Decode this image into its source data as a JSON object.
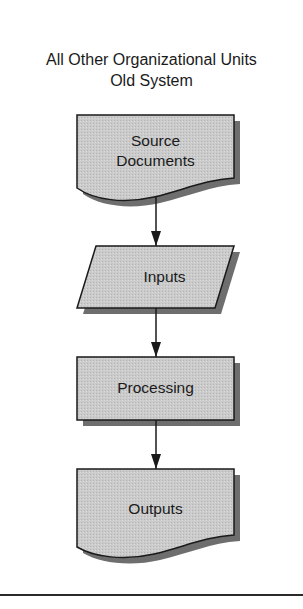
{
  "diagram": {
    "title_line1": "All Other Organizational Units",
    "title_line2": "Old System",
    "nodes": [
      {
        "id": "source-documents",
        "shape": "document",
        "label_line1": "Source",
        "label_line2": "Documents"
      },
      {
        "id": "inputs",
        "shape": "parallelogram",
        "label": "Inputs"
      },
      {
        "id": "processing",
        "shape": "rectangle",
        "label": "Processing"
      },
      {
        "id": "outputs",
        "shape": "document",
        "label": "Outputs"
      }
    ],
    "edges": [
      {
        "from": "source-documents",
        "to": "inputs"
      },
      {
        "from": "inputs",
        "to": "processing"
      },
      {
        "from": "processing",
        "to": "outputs"
      }
    ],
    "colors": {
      "fill": "#c8c8c8",
      "shadow": "#6e6e6e",
      "stroke": "#1a1a1a",
      "background": "#ffffff"
    }
  }
}
